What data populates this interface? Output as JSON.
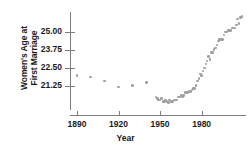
{
  "chart_data": {
    "type": "scatter",
    "title": "",
    "xlabel": "Year",
    "ylabel": "Women's Age at First Marriage",
    "ylabel_lines": [
      "Women's Age at",
      "First Marriage"
    ],
    "xlim": [
      1885,
      2012
    ],
    "ylim": [
      19.6,
      26.4
    ],
    "xticks": [
      1890,
      1920,
      1950,
      1980
    ],
    "xticklabels": [
      "1890",
      "1920",
      "1950",
      "1980"
    ],
    "yticks": [
      21.25,
      22.5,
      23.75,
      25.0
    ],
    "yticklabels": [
      "21.25",
      "22.50",
      "23.75",
      "25.00"
    ],
    "grid": false,
    "legend": null,
    "marker_color": "#a0a0a0",
    "axis_color": "#7d7d7d",
    "points": [
      [
        1890,
        22.0
      ],
      [
        1900,
        21.9
      ],
      [
        1910,
        21.6
      ],
      [
        1920,
        21.2
      ],
      [
        1930,
        21.3
      ],
      [
        1940,
        21.5
      ],
      [
        1947,
        20.5
      ],
      [
        1948,
        20.4
      ],
      [
        1949,
        20.3
      ],
      [
        1950,
        20.3
      ],
      [
        1951,
        20.4
      ],
      [
        1952,
        20.2
      ],
      [
        1953,
        20.2
      ],
      [
        1954,
        20.3
      ],
      [
        1955,
        20.2
      ],
      [
        1956,
        20.1
      ],
      [
        1957,
        20.3
      ],
      [
        1958,
        20.2
      ],
      [
        1959,
        20.2
      ],
      [
        1960,
        20.3
      ],
      [
        1961,
        20.3
      ],
      [
        1962,
        20.3
      ],
      [
        1963,
        20.5
      ],
      [
        1964,
        20.5
      ],
      [
        1965,
        20.6
      ],
      [
        1966,
        20.5
      ],
      [
        1967,
        20.6
      ],
      [
        1968,
        20.8
      ],
      [
        1969,
        20.8
      ],
      [
        1970,
        20.8
      ],
      [
        1971,
        20.9
      ],
      [
        1972,
        20.9
      ],
      [
        1973,
        21.0
      ],
      [
        1974,
        21.1
      ],
      [
        1975,
        21.1
      ],
      [
        1976,
        21.3
      ],
      [
        1977,
        21.6
      ],
      [
        1978,
        21.8
      ],
      [
        1979,
        22.1
      ],
      [
        1980,
        22.0
      ],
      [
        1981,
        22.3
      ],
      [
        1982,
        22.5
      ],
      [
        1983,
        22.8
      ],
      [
        1984,
        23.0
      ],
      [
        1985,
        23.3
      ],
      [
        1986,
        23.1
      ],
      [
        1987,
        23.6
      ],
      [
        1988,
        23.6
      ],
      [
        1989,
        23.8
      ],
      [
        1990,
        23.9
      ],
      [
        1991,
        24.1
      ],
      [
        1992,
        24.4
      ],
      [
        1993,
        24.5
      ],
      [
        1994,
        24.5
      ],
      [
        1995,
        24.5
      ],
      [
        1996,
        24.8
      ],
      [
        1997,
        25.0
      ],
      [
        1998,
        25.0
      ],
      [
        1999,
        25.1
      ],
      [
        2000,
        25.1
      ],
      [
        2001,
        25.1
      ],
      [
        2002,
        25.3
      ],
      [
        2003,
        25.3
      ],
      [
        2004,
        25.3
      ],
      [
        2005,
        25.5
      ],
      [
        2006,
        25.9
      ],
      [
        2007,
        25.6
      ],
      [
        2008,
        26.0
      ],
      [
        2009,
        26.1
      ]
    ]
  }
}
